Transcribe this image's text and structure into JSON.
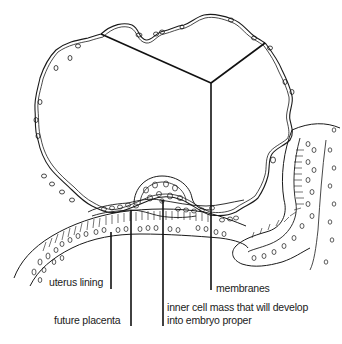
{
  "diagram": {
    "type": "biological cross-section illustration",
    "colors": {
      "background": "#ffffff",
      "ink": "#1a1a1a",
      "leader_lines": "#111111"
    },
    "labels": {
      "membranes": "membranes",
      "uterus_lining": "uterus lining",
      "future_placenta": "future placenta",
      "inner_cell_mass_line1": "inner cell mass that will develop",
      "inner_cell_mass_line2": "into embryo proper"
    }
  }
}
